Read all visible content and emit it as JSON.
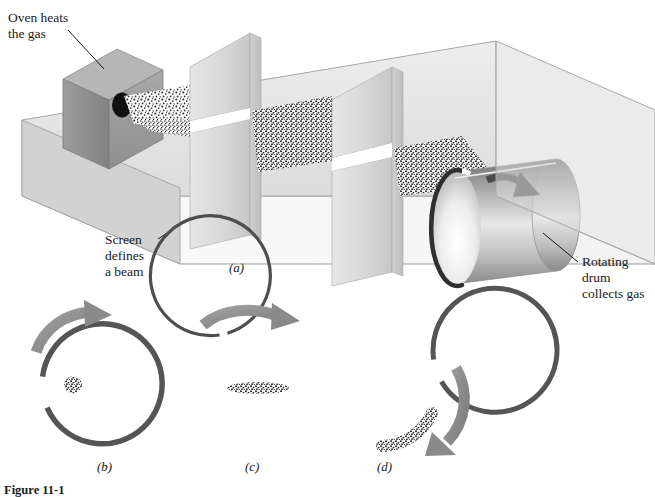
{
  "figure": {
    "title_number": "Figure 11-1",
    "caption_text": "",
    "annotations": [
      {
        "id": "oven",
        "name": "oven-label",
        "lines": [
          "Oven heats",
          "the gas"
        ],
        "x": 8,
        "y": 22,
        "leader": {
          "x1": 68,
          "y1": 30,
          "x2": 104,
          "y2": 69
        }
      },
      {
        "id": "screen",
        "name": "screen-label",
        "lines": [
          "Screen",
          "defines",
          "a beam"
        ],
        "x": 105,
        "y": 240,
        "leader": {
          "x1": 160,
          "y1": 240,
          "x2": 187,
          "y2": 220
        }
      },
      {
        "id": "drum",
        "name": "rotating-drum-label",
        "lines": [
          "Rotating",
          "drum",
          "collects gas"
        ],
        "x": 582,
        "y": 262,
        "leader": {
          "x1": 578,
          "y1": 262,
          "x2": 543,
          "y2": 233
        }
      }
    ],
    "panel_labels": [
      {
        "id": "a",
        "text": "(a)",
        "x": 229,
        "y": 272
      },
      {
        "id": "b",
        "text": "(b)",
        "x": 97,
        "y": 471
      },
      {
        "id": "c",
        "text": "(c)",
        "x": 245,
        "y": 471
      },
      {
        "id": "d",
        "text": "(d)",
        "x": 377,
        "y": 471
      }
    ]
  },
  "apparatus": {
    "oven": {
      "label": "oven-block",
      "aperture_label": "oven-aperture"
    },
    "screens": [
      {
        "label": "screen-first",
        "slit": "slit-1"
      },
      {
        "label": "screen-second",
        "slit": "slit-2"
      }
    ],
    "beam": {
      "label": "molecular-beam",
      "description": "speckled gas beam"
    },
    "drum": {
      "label": "rotating-drum",
      "rotation_arrow": "rotation-arrow",
      "slot": "drum-slot"
    }
  },
  "drum_panels": [
    {
      "id": "b",
      "name": "drum-cross-section-b",
      "cx": 99,
      "cy": 388,
      "r": 60,
      "ring_width": 5.5,
      "gap_start_deg": 188,
      "gap_end_deg": 210,
      "deposit": {
        "type": "blob",
        "cx": 73,
        "cy": 385,
        "rx": 9,
        "ry": 8
      },
      "arrow": {
        "start_deg": 214,
        "end_deg": 297,
        "radius": 74
      }
    },
    {
      "id": "c",
      "name": "drum-cross-section-c",
      "cx": 247,
      "cy": 388,
      "r": 60,
      "ring_width": 3.2,
      "gap_start_deg": 243,
      "gap_end_deg": 268,
      "deposit": {
        "type": "smear",
        "cx": 258,
        "cy": 388,
        "rx": 31,
        "ry": 6
      },
      "arrow": {
        "start_deg": 200,
        "end_deg": 292,
        "radius": 76
      }
    },
    {
      "id": "d",
      "name": "drum-cross-section-d",
      "cx": 380,
      "cy": 390,
      "r": 62,
      "ring_width": 5.0,
      "gap_start_deg": 330,
      "gap_end_deg": 352,
      "deposit": {
        "type": "arc",
        "start_deg": 20,
        "end_deg": 88,
        "radius": 56
      },
      "arrow": {
        "start_deg": 352,
        "end_deg": 62,
        "radius": 78
      }
    }
  ],
  "colors": {
    "background": "#ffffff",
    "text": "#1a1a1a",
    "box_floor": "#ffffff",
    "box_back_wall": "#e4e4e4",
    "screen_front_light": "#dcdcdc",
    "screen_side_mid": "#c9c9c9",
    "screen_shadow": "#bdbdbd",
    "oven_front": "#9b9b9b",
    "oven_top": "#b4b4b4",
    "oven_side": "#8d8d8d",
    "aperture": "#111111",
    "drum_dark": "#7d7d7d",
    "drum_light": "#f2f2f2",
    "drum_rim": "#3a3a3a",
    "arrow_gray": "#8a8a8a",
    "ring_gray": "#555555",
    "speckle": "#2b2b2b",
    "outline": "#9a9a9a"
  }
}
